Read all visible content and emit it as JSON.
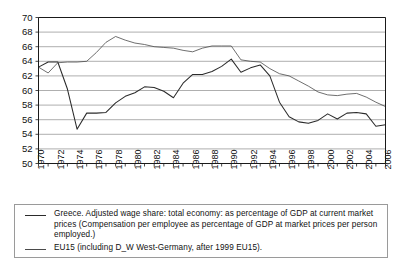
{
  "chart_data": {
    "type": "line",
    "title": "",
    "subtitle": "",
    "xlabel": "",
    "ylabel": "",
    "xlim": [
      1970,
      2006
    ],
    "ylim": [
      50,
      70
    ],
    "yticks": [
      50,
      52,
      54,
      56,
      58,
      60,
      62,
      64,
      66,
      68,
      70
    ],
    "xticks": [
      1970,
      1971,
      1972,
      1973,
      1974,
      1975,
      1976,
      1977,
      1978,
      1979,
      1980,
      1981,
      1982,
      1983,
      1984,
      1985,
      1986,
      1987,
      1988,
      1989,
      1990,
      1991,
      1992,
      1993,
      1994,
      1995,
      1996,
      1997,
      1998,
      1999,
      2000,
      2001,
      2002,
      2003,
      2004,
      2005,
      2006
    ],
    "xtick_labels": [
      "1970",
      "1972",
      "1974",
      "1976",
      "1978",
      "1980",
      "1982",
      "1984",
      "1986",
      "1988",
      "1990",
      "1992",
      "1994",
      "1996",
      "1998",
      "2000",
      "2002",
      "2004",
      "2006"
    ],
    "xtick_label_years": [
      1970,
      1972,
      1974,
      1976,
      1978,
      1980,
      1982,
      1984,
      1986,
      1988,
      1990,
      1992,
      1994,
      1996,
      1998,
      2000,
      2002,
      2004,
      2006
    ],
    "grid": true,
    "grid_axis": "y",
    "legend_position": "below",
    "x": [
      1970,
      1971,
      1972,
      1973,
      1974,
      1975,
      1976,
      1977,
      1978,
      1979,
      1980,
      1981,
      1982,
      1983,
      1984,
      1985,
      1986,
      1987,
      1988,
      1989,
      1990,
      1991,
      1992,
      1993,
      1994,
      1995,
      1996,
      1997,
      1998,
      1999,
      2000,
      2001,
      2002,
      2003,
      2004,
      2005,
      2006
    ],
    "series": [
      {
        "name": "Greece. Adjusted wage share: total economy: as percentage of GDP at current market prices (Compensation per employee as percentage of GDP at market prices per person employed.)",
        "key": "greece",
        "color": "#2b2b2b",
        "values": [
          63.2,
          63.9,
          63.9,
          60.2,
          54.7,
          56.9,
          56.9,
          57.0,
          58.3,
          59.2,
          59.7,
          60.5,
          60.4,
          59.9,
          59.0,
          61.0,
          62.2,
          62.2,
          62.6,
          63.3,
          64.3,
          62.5,
          63.1,
          63.5,
          62.0,
          58.4,
          56.4,
          55.7,
          55.5,
          55.9,
          56.8,
          56.1,
          56.9,
          57.0,
          56.8,
          55.1,
          55.3
        ]
      },
      {
        "name": "EU15 (including D_W West-Germany, after 1999 EU15).",
        "key": "eu15",
        "color": "#4a4a4a",
        "values": [
          63.2,
          62.4,
          63.8,
          63.9,
          63.9,
          64.0,
          65.2,
          66.6,
          67.4,
          66.9,
          66.5,
          66.3,
          66.0,
          65.9,
          65.8,
          65.5,
          65.3,
          65.8,
          66.1,
          66.1,
          66.1,
          64.2,
          64.0,
          63.9,
          63.0,
          62.3,
          62.0,
          61.3,
          60.6,
          59.8,
          59.4,
          59.3,
          59.5,
          59.6,
          59.1,
          58.4,
          57.8
        ]
      }
    ]
  },
  "legend": {
    "entries": [
      {
        "line1": "Greece. Adjusted wage share: total economy: as percentage of GDP at current market",
        "line2": "prices (Compensation per employee as percentage of GDP at market prices per person",
        "line3": "employed.)"
      },
      {
        "line1": "EU15 (including D_W West-Germany, after 1999 EU15)."
      }
    ]
  },
  "colors": {
    "greece": "#2b2b2b",
    "eu15": "#4a4a4a",
    "grid": "#8c8c8c",
    "axis": "#1a1a1a",
    "background": "#ffffff"
  }
}
